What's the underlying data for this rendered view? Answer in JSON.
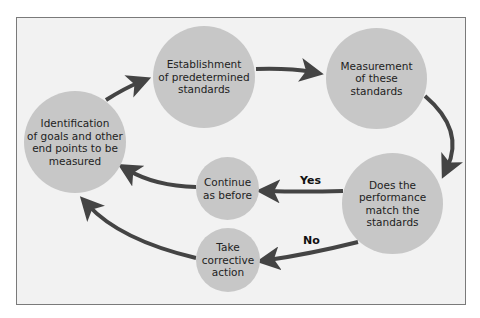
{
  "diagram": {
    "nodes": [
      {
        "id": "identify",
        "label": "Identification\nof goals and other\nend points to be\nmeasured"
      },
      {
        "id": "establish",
        "label": "Establishment\nof predetermined\nstandards"
      },
      {
        "id": "measure",
        "label": "Measurement\nof these\nstandards"
      },
      {
        "id": "compare",
        "label": "Does the\nperformance\nmatch the\nstandards"
      },
      {
        "id": "continue",
        "label": "Continue\nas before"
      },
      {
        "id": "corrective",
        "label": "Take\ncorrective\naction"
      }
    ],
    "edges": [
      {
        "from": "identify",
        "to": "establish",
        "label": ""
      },
      {
        "from": "establish",
        "to": "measure",
        "label": ""
      },
      {
        "from": "measure",
        "to": "compare",
        "label": ""
      },
      {
        "from": "compare",
        "to": "continue",
        "label": "Yes"
      },
      {
        "from": "compare",
        "to": "corrective",
        "label": "No"
      },
      {
        "from": "continue",
        "to": "identify",
        "label": ""
      },
      {
        "from": "corrective",
        "to": "identify",
        "label": ""
      }
    ],
    "colors": {
      "node": "#c7c7c7",
      "arrow": "#444444",
      "background": "#f2f2f2",
      "border": "#7a7a7a"
    }
  }
}
